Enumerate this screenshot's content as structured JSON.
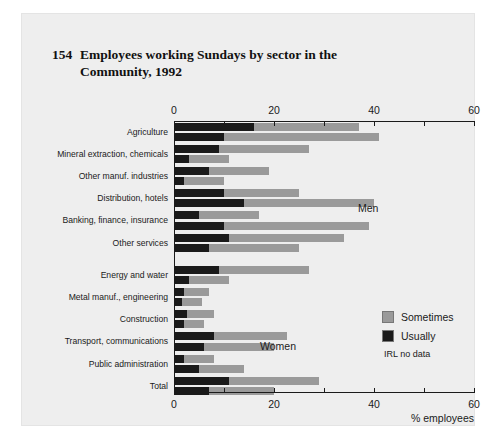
{
  "title": {
    "number": "154",
    "text": "Employees working Sundays by sector in the Community, 1992"
  },
  "annotations": {
    "men": "Men",
    "women": "Women",
    "no_data_note": "IRL no data"
  },
  "legend": {
    "position": "inside-bottom-right",
    "items": [
      {
        "label": "Sometimes",
        "color": "#9a9a9a"
      },
      {
        "label": "Usually",
        "color": "#1a1a1a"
      }
    ]
  },
  "colors": {
    "sometimes": "#9a9a9a",
    "usually": "#1a1a1a",
    "panel_background": "#eeeeee",
    "axis": "#1a1a1a"
  },
  "chart_data": {
    "type": "bar",
    "orientation": "horizontal",
    "stacked": true,
    "grouped_pairs": true,
    "xlabel": "% employees",
    "ylabel": "",
    "xlim": [
      0,
      60
    ],
    "xticks": [
      0,
      20,
      40,
      60
    ],
    "xticks_minor": [
      0,
      10,
      20,
      30,
      40,
      50,
      60
    ],
    "grid": false,
    "axis_top": true,
    "axis_bottom": true,
    "series": [
      {
        "name": "Usually",
        "color": "#1a1a1a"
      },
      {
        "name": "Sometimes",
        "color": "#9a9a9a"
      }
    ],
    "groups": [
      {
        "name": "Men",
        "categories": [
          {
            "label": "Agriculture",
            "bars": [
              {
                "usually": 16.0,
                "sometimes": 21.0,
                "total": 37.0
              },
              {
                "usually": 10.0,
                "sometimes": 31.0,
                "total": 41.0
              }
            ]
          },
          {
            "label": "Mineral extraction, chemicals",
            "bars": [
              {
                "usually": 9.0,
                "sometimes": 18.0,
                "total": 27.0
              },
              {
                "usually": 3.0,
                "sometimes": 8.0,
                "total": 11.0
              }
            ]
          },
          {
            "label": "Other manuf. industries",
            "bars": [
              {
                "usually": 7.0,
                "sometimes": 12.0,
                "total": 19.0
              },
              {
                "usually": 2.0,
                "sometimes": 8.0,
                "total": 10.0
              }
            ]
          },
          {
            "label": "Distribution, hotels",
            "bars": [
              {
                "usually": 10.0,
                "sometimes": 15.0,
                "total": 25.0
              },
              {
                "usually": 14.0,
                "sometimes": 26.0,
                "total": 40.0
              }
            ]
          },
          {
            "label": "Banking, finance, insurance",
            "bars": [
              {
                "usually": 5.0,
                "sometimes": 12.0,
                "total": 17.0
              },
              {
                "usually": 10.0,
                "sometimes": 29.0,
                "total": 39.0
              }
            ]
          },
          {
            "label": "Other services",
            "bars": [
              {
                "usually": 11.0,
                "sometimes": 23.0,
                "total": 34.0
              },
              {
                "usually": 7.0,
                "sometimes": 18.0,
                "total": 25.0
              }
            ]
          }
        ]
      },
      {
        "name": "Women",
        "categories": [
          {
            "label": "Energy and water",
            "bars": [
              {
                "usually": 9.0,
                "sometimes": 18.0,
                "total": 27.0
              },
              {
                "usually": 3.0,
                "sometimes": 8.0,
                "total": 11.0
              }
            ]
          },
          {
            "label": "Metal manuf., engineering",
            "bars": [
              {
                "usually": 2.0,
                "sometimes": 5.0,
                "total": 7.0
              },
              {
                "usually": 1.5,
                "sometimes": 4.0,
                "total": 5.5
              }
            ]
          },
          {
            "label": "Construction",
            "bars": [
              {
                "usually": 2.5,
                "sometimes": 5.5,
                "total": 8.0
              },
              {
                "usually": 2.0,
                "sometimes": 4.0,
                "total": 6.0
              }
            ]
          },
          {
            "label": "Transport, communications",
            "bars": [
              {
                "usually": 8.0,
                "sometimes": 14.5,
                "total": 22.5
              },
              {
                "usually": 6.0,
                "sometimes": 14.0,
                "total": 20.0
              }
            ]
          },
          {
            "label": "Public administration",
            "bars": [
              {
                "usually": 2.0,
                "sometimes": 6.0,
                "total": 8.0
              },
              {
                "usually": 5.0,
                "sometimes": 9.0,
                "total": 14.0
              }
            ]
          },
          {
            "label": "Total",
            "bars": [
              {
                "usually": 11.0,
                "sometimes": 18.0,
                "total": 29.0
              },
              {
                "usually": 7.0,
                "sometimes": 13.0,
                "total": 20.0
              }
            ]
          }
        ]
      }
    ]
  }
}
